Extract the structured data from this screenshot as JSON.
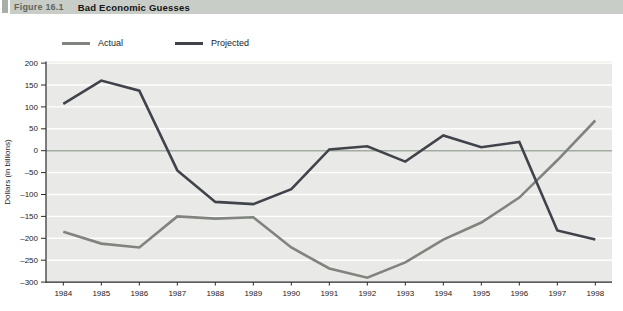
{
  "header": {
    "figure_label": "Figure 16.1",
    "title": "Bad Economic Guesses"
  },
  "colors": {
    "header_band": "#c9cdc8",
    "header_block": "#a9aea9",
    "plot_background": "#e9e9e7",
    "gridline": "#ffffff",
    "zero_line": "#a4aba3",
    "axis": "#2b2b2b",
    "tick_text": "#222222",
    "actual_line": "#81847e",
    "projected_line": "#41434b"
  },
  "chart_data": {
    "type": "line",
    "x": [
      1984,
      1985,
      1986,
      1987,
      1988,
      1989,
      1990,
      1991,
      1992,
      1993,
      1994,
      1995,
      1996,
      1997,
      1998
    ],
    "series": [
      {
        "name": "Actual",
        "color": "#81847e",
        "values": [
          -185,
          -212,
          -221,
          -150,
          -155,
          -152,
          -221,
          -269,
          -290,
          -255,
          -203,
          -164,
          -107,
          -22,
          69
        ]
      },
      {
        "name": "Projected",
        "color": "#41434b",
        "values": [
          107,
          160,
          137,
          -45,
          -117,
          -122,
          -88,
          3,
          10,
          -25,
          35,
          8,
          20,
          -182,
          -203
        ]
      }
    ],
    "title": "Bad Economic Guesses",
    "xlabel": "",
    "ylabel": "Dollars (in billions)",
    "ylim": [
      -300,
      200
    ],
    "ytick_step": 50,
    "grid": true,
    "zero_line_highlighted": true,
    "legend_position": "top-left"
  }
}
